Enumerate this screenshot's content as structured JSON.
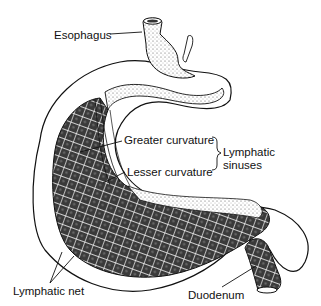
{
  "figure": {
    "labels": {
      "esophagus": "Esophagus",
      "greater_curvature": "Greater curvature",
      "lesser_curvature": "Lesser curvature",
      "lymphatic_sinuses": "Lymphatic sinuses",
      "lymphatic_net": "Lymphatic net",
      "duodenum": "Duodenum"
    },
    "colors": {
      "ink": "#111111",
      "background": "#ffffff"
    }
  }
}
